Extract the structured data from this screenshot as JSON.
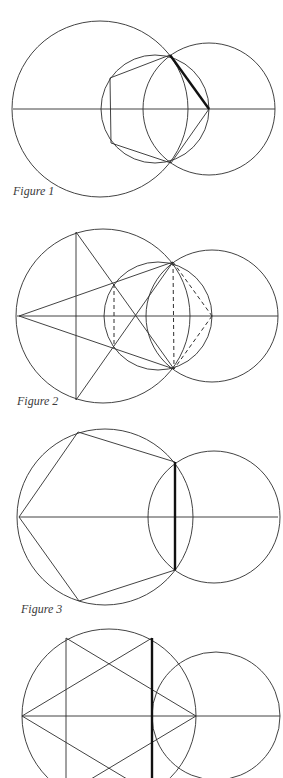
{
  "figures": [
    {
      "id": 1,
      "caption": "Figure 1",
      "description": "Regular pentagon inscribed in a circle, constructed from two intersecting circles; one side emphasized in bold"
    },
    {
      "id": 2,
      "caption": "Figure 2",
      "description": "Pentagram within large circle, with overlapping circles and dashed construction lines"
    },
    {
      "id": 3,
      "caption": "Figure 3",
      "description": "Regular pentagon inscribed in large circle, right side (bold) formed by intersection with second circle"
    },
    {
      "id": 4,
      "caption": "Figure 4",
      "description": "Hexagram inscribed in large circle with intersecting second circle; bold vertical chord"
    }
  ],
  "colors": {
    "background": "#ffffff",
    "line": "#2e2e2e",
    "bold_line": "#111111"
  }
}
